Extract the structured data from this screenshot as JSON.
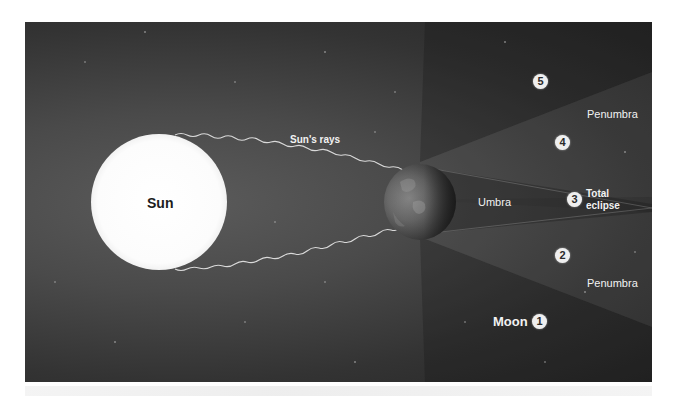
{
  "diagram": {
    "labels": {
      "sun": "Sun",
      "sun_rays": "Sun's rays",
      "umbra": "Umbra",
      "penumbra_upper": "Penumbra",
      "penumbra_lower": "Penumbra",
      "total_eclipse_line1": "Total",
      "total_eclipse_line2": "eclipse",
      "moon": "Moon"
    },
    "moon_positions": [
      {
        "number": "1",
        "zone": "outside shadow"
      },
      {
        "number": "2",
        "zone": "penumbra"
      },
      {
        "number": "3",
        "zone": "umbra (total eclipse)"
      },
      {
        "number": "4",
        "zone": "penumbra"
      },
      {
        "number": "5",
        "zone": "outside shadow"
      }
    ],
    "colors": {
      "background_light": "#5b5b5b",
      "background_dark": "#262626",
      "sun": "#fbfbfb",
      "earth": "#6e6e6e",
      "label": "#f2f2f2",
      "badge": "#efefef"
    }
  }
}
